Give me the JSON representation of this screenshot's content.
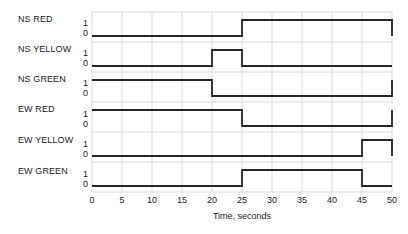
{
  "chart_data": {
    "type": "line",
    "title": "",
    "xlabel": "Time, seconds",
    "ylabel": "",
    "xlim": [
      0,
      50
    ],
    "ylim": [
      0,
      1
    ],
    "grid": true,
    "legend": "none",
    "x_ticks": [
      0,
      5,
      10,
      15,
      20,
      25,
      30,
      35,
      40,
      45,
      50
    ],
    "x_tick_labels": [
      "0",
      "5",
      "10",
      "15",
      "20",
      "25",
      "30",
      "35",
      "40",
      "45",
      "50"
    ],
    "y_tick_labels": [
      "1",
      "0"
    ],
    "signal_names": [
      "NS RED",
      "NS YELLOW",
      "NS GREEN",
      "EW RED",
      "EW YELLOW",
      "EW GREEN"
    ],
    "series": [
      {
        "name": "NS RED",
        "transitions": [
          [
            0,
            0
          ],
          [
            25,
            1
          ],
          [
            50,
            0
          ]
        ],
        "values": [
          0,
          0,
          0,
          0,
          0,
          1,
          1,
          1,
          1,
          1,
          0
        ]
      },
      {
        "name": "NS YELLOW",
        "transitions": [
          [
            0,
            0
          ],
          [
            20,
            1
          ],
          [
            25,
            0
          ],
          [
            50,
            0
          ]
        ],
        "values": [
          0,
          0,
          0,
          0,
          1,
          0,
          0,
          0,
          0,
          0,
          0
        ]
      },
      {
        "name": "NS GREEN",
        "transitions": [
          [
            0,
            1
          ],
          [
            20,
            0
          ],
          [
            50,
            1
          ]
        ],
        "values": [
          1,
          1,
          1,
          1,
          0,
          0,
          0,
          0,
          0,
          0,
          1
        ]
      },
      {
        "name": "EW RED",
        "transitions": [
          [
            0,
            1
          ],
          [
            25,
            0
          ],
          [
            50,
            1
          ]
        ],
        "values": [
          1,
          1,
          1,
          1,
          1,
          0,
          0,
          0,
          0,
          0,
          1
        ]
      },
      {
        "name": "EW YELLOW",
        "transitions": [
          [
            0,
            0
          ],
          [
            45,
            1
          ],
          [
            50,
            0
          ]
        ],
        "values": [
          0,
          0,
          0,
          0,
          0,
          0,
          0,
          0,
          0,
          1,
          0
        ]
      },
      {
        "name": "EW GREEN",
        "transitions": [
          [
            0,
            0
          ],
          [
            25,
            1
          ],
          [
            45,
            0
          ],
          [
            50,
            0
          ]
        ],
        "values": [
          0,
          0,
          0,
          0,
          0,
          1,
          1,
          1,
          1,
          0,
          0
        ]
      }
    ],
    "colors": {
      "waveform": "#262626",
      "grid": "#d9d9d9",
      "text": "#222222",
      "background": "#ffffff"
    }
  },
  "labels": {
    "ns_red": "NS RED",
    "ns_yellow": "NS YELLOW",
    "ns_green": "NS GREEN",
    "ew_red": "EW RED",
    "ew_yellow": "EW YELLOW",
    "ew_green": "EW GREEN",
    "high": "1",
    "low": "0",
    "xaxis_title": "Time, seconds"
  },
  "xticks": {
    "t0": "0",
    "t5": "5",
    "t10": "10",
    "t15": "15",
    "t20": "20",
    "t25": "25",
    "t30": "30",
    "t35": "35",
    "t40": "40",
    "t45": "45",
    "t50": "50"
  }
}
